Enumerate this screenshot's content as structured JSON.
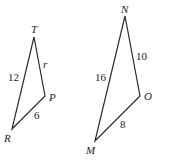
{
  "diagram": {
    "triangles": [
      {
        "name": "TPR",
        "vertices": [
          {
            "label": "T",
            "x": 34,
            "y": 37,
            "lx": 31,
            "ly": 33
          },
          {
            "label": "P",
            "x": 45,
            "y": 96,
            "lx": 49,
            "ly": 101
          },
          {
            "label": "R",
            "x": 12,
            "y": 129,
            "lx": 4,
            "ly": 142
          }
        ],
        "sides": [
          {
            "from": "T",
            "to": "R",
            "label": "12",
            "lx": 8,
            "ly": 81
          },
          {
            "from": "T",
            "to": "P",
            "label": "r",
            "lx": 43,
            "ly": 68,
            "italic": true
          },
          {
            "from": "R",
            "to": "P",
            "label": "6",
            "lx": 34,
            "ly": 119
          }
        ]
      },
      {
        "name": "NOM",
        "vertices": [
          {
            "label": "N",
            "x": 125,
            "y": 16,
            "lx": 121,
            "ly": 13
          },
          {
            "label": "O",
            "x": 140,
            "y": 96,
            "lx": 144,
            "ly": 100
          },
          {
            "label": "M",
            "x": 95,
            "y": 141,
            "lx": 86,
            "ly": 154
          }
        ],
        "sides": [
          {
            "from": "N",
            "to": "M",
            "label": "16",
            "lx": 95,
            "ly": 81
          },
          {
            "from": "N",
            "to": "O",
            "label": "10",
            "lx": 136,
            "ly": 60
          },
          {
            "from": "M",
            "to": "O",
            "label": "8",
            "lx": 120,
            "ly": 128
          }
        ]
      }
    ]
  }
}
